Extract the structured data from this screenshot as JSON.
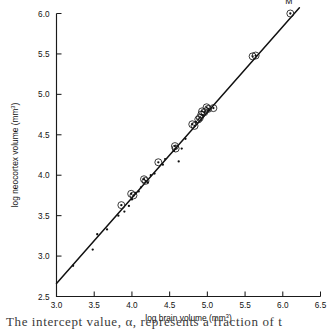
{
  "figure": {
    "background_color": "#ffffff",
    "line_color": "#111111",
    "marker_color": "#111111",
    "caption_fragment": "The intercept value, α, represents a fraction of t"
  },
  "annotations": [
    {
      "text": "M",
      "x": 6.08,
      "y": 6.12,
      "name": "point-label-m"
    }
  ],
  "chart_data": {
    "type": "scatter",
    "title": "",
    "xlabel": "log brain volume (mm³)",
    "ylabel": "log neocortex volume (mm³)",
    "xlabel_base": "log brain volume (mm",
    "xlabel_sup": "3",
    "xlabel_tail": ")",
    "ylabel_base": "log neocortex volume (mm",
    "ylabel_sup": "3",
    "ylabel_tail": ")",
    "xlim": [
      3.0,
      6.5
    ],
    "ylim": [
      2.5,
      6.0
    ],
    "xticks": [
      3.0,
      3.5,
      4.0,
      4.5,
      5.0,
      5.5,
      6.0,
      6.5
    ],
    "xticklabels": [
      "3.0",
      "3.5",
      "4.0",
      "4.5",
      "5.0",
      "5.5",
      "6.0",
      "6.5"
    ],
    "yticks": [
      2.5,
      3.0,
      3.5,
      4.0,
      4.5,
      5.0,
      5.5,
      6.0
    ],
    "yticklabels": [
      "2.5",
      "3.0",
      "3.5",
      "4.0",
      "4.5",
      "5.0",
      "5.5",
      "6.0"
    ],
    "grid": false,
    "legend": null,
    "fit_line": {
      "name": "regression-line",
      "x_start": 3.0,
      "y_start": 2.66,
      "x_end": 6.22,
      "y_end": 6.07,
      "slope": 1.059,
      "intercept": -0.511
    },
    "series": [
      {
        "name": "circled-points",
        "marker": "dot-in-circle",
        "points": [
          [
            3.86,
            3.63
          ],
          [
            3.99,
            3.77
          ],
          [
            4.02,
            3.75
          ],
          [
            4.16,
            3.95
          ],
          [
            4.18,
            3.93
          ],
          [
            4.35,
            4.16
          ],
          [
            4.57,
            4.36
          ],
          [
            4.58,
            4.33
          ],
          [
            4.8,
            4.63
          ],
          [
            4.83,
            4.61
          ],
          [
            4.88,
            4.69
          ],
          [
            4.9,
            4.71
          ],
          [
            4.92,
            4.75
          ],
          [
            4.93,
            4.79
          ],
          [
            4.96,
            4.78
          ],
          [
            4.99,
            4.84
          ],
          [
            5.01,
            4.82
          ],
          [
            5.08,
            4.83
          ],
          [
            5.6,
            5.47
          ],
          [
            5.64,
            5.48
          ],
          [
            6.1,
            6.0
          ]
        ]
      },
      {
        "name": "plain-points",
        "marker": "dot",
        "points": [
          [
            3.22,
            2.88
          ],
          [
            3.48,
            3.08
          ],
          [
            3.54,
            3.27
          ],
          [
            3.67,
            3.33
          ],
          [
            3.82,
            3.5
          ],
          [
            3.9,
            3.55
          ],
          [
            3.96,
            3.62
          ],
          [
            4.0,
            3.7
          ],
          [
            4.05,
            3.78
          ],
          [
            4.09,
            3.8
          ],
          [
            4.12,
            3.85
          ],
          [
            4.21,
            3.91
          ],
          [
            4.25,
            4.0
          ],
          [
            4.3,
            4.02
          ],
          [
            4.41,
            4.13
          ],
          [
            4.44,
            4.2
          ],
          [
            4.56,
            4.3
          ],
          [
            4.62,
            4.17
          ],
          [
            4.66,
            4.33
          ],
          [
            4.71,
            4.45
          ],
          [
            4.85,
            4.66
          ],
          [
            4.94,
            4.74
          ],
          [
            5.02,
            4.8
          ]
        ]
      }
    ]
  }
}
